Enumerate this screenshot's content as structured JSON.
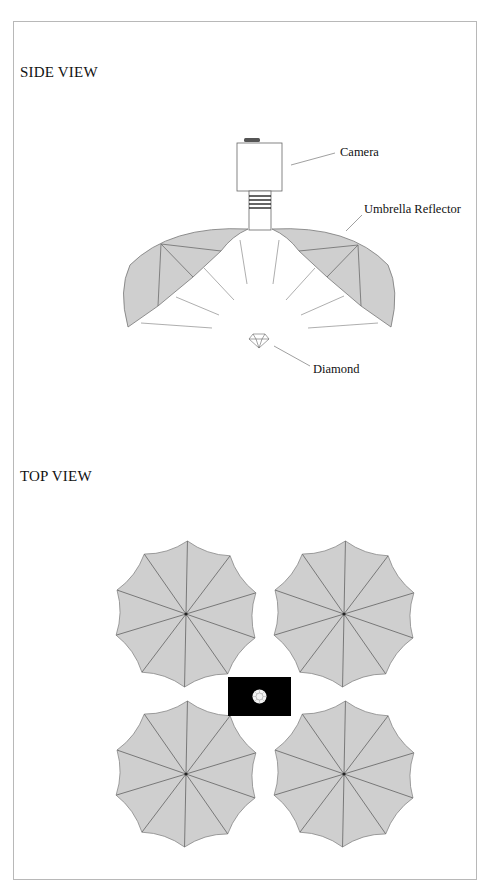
{
  "side_view": {
    "title": "SIDE VIEW",
    "labels": {
      "camera": "Camera",
      "umbrella": "Umbrella Reflector",
      "diamond": "Diamond"
    }
  },
  "top_view": {
    "title": "TOP VIEW",
    "umbrella_count": 4,
    "umbrella_ribs": 10
  },
  "colors": {
    "umbrella_fill": "#cfcfcf",
    "rib_stroke": "#6e6e6e",
    "frame_border": "#b8b8b8",
    "diamond_backdrop": "#000000"
  }
}
